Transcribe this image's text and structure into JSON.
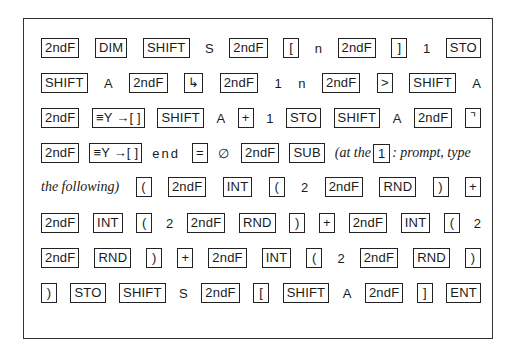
{
  "rows": [
    {
      "tokens": [
        {
          "t": "key",
          "v": "2ndF"
        },
        {
          "t": "key",
          "v": "DIM"
        },
        {
          "t": "key",
          "v": "SHIFT"
        },
        {
          "t": "txt",
          "v": "S"
        },
        {
          "t": "key",
          "v": "2ndF"
        },
        {
          "t": "key",
          "v": "["
        },
        {
          "t": "txt",
          "v": "n"
        },
        {
          "t": "key",
          "v": "2ndF"
        },
        {
          "t": "key",
          "v": "]"
        },
        {
          "t": "txt",
          "v": "1"
        },
        {
          "t": "key",
          "v": "STO"
        }
      ]
    },
    {
      "tokens": [
        {
          "t": "key",
          "v": "SHIFT"
        },
        {
          "t": "txt",
          "v": "A"
        },
        {
          "t": "key",
          "v": "2ndF"
        },
        {
          "t": "key",
          "v": "↳"
        },
        {
          "t": "key",
          "v": "2ndF"
        },
        {
          "t": "txt",
          "v": "1"
        },
        {
          "t": "txt",
          "v": "n"
        },
        {
          "t": "key",
          "v": "2ndF"
        },
        {
          "t": "key",
          "v": ">"
        },
        {
          "t": "key",
          "v": "SHIFT"
        },
        {
          "t": "txt",
          "v": "A"
        }
      ]
    },
    {
      "tokens": [
        {
          "t": "key",
          "v": "2ndF"
        },
        {
          "t": "key",
          "v": "≡Y →[ ]"
        },
        {
          "t": "key",
          "v": "SHIFT"
        },
        {
          "t": "txt",
          "v": "A"
        },
        {
          "t": "key",
          "v": "+"
        },
        {
          "t": "txt",
          "v": "1"
        },
        {
          "t": "key",
          "v": "STO"
        },
        {
          "t": "key",
          "v": "SHIFT"
        },
        {
          "t": "txt",
          "v": "A"
        },
        {
          "t": "key",
          "v": "2ndF"
        },
        {
          "t": "key",
          "v": "⌝"
        }
      ]
    },
    {
      "tokens": [
        {
          "t": "key",
          "v": "2ndF"
        },
        {
          "t": "key",
          "v": "≡Y →[ ]"
        },
        {
          "t": "txt",
          "v": "end",
          "spaced": true
        },
        {
          "t": "key",
          "v": "="
        },
        {
          "t": "txt",
          "v": "∅"
        },
        {
          "t": "key",
          "v": "2ndF"
        },
        {
          "t": "key",
          "v": "SUB"
        },
        {
          "t": "note",
          "before": "(at the ",
          "key": "1",
          "after": ": prompt, type"
        }
      ]
    },
    {
      "tokens": [
        {
          "t": "ital",
          "v": "the following)"
        },
        {
          "t": "key",
          "v": "("
        },
        {
          "t": "key",
          "v": "2ndF"
        },
        {
          "t": "key",
          "v": "INT"
        },
        {
          "t": "key",
          "v": "("
        },
        {
          "t": "txt",
          "v": "2"
        },
        {
          "t": "key",
          "v": "2ndF"
        },
        {
          "t": "key",
          "v": "RND"
        },
        {
          "t": "key",
          "v": ")"
        },
        {
          "t": "key",
          "v": "+"
        }
      ]
    },
    {
      "tokens": [
        {
          "t": "key",
          "v": "2ndF"
        },
        {
          "t": "key",
          "v": "INT"
        },
        {
          "t": "key",
          "v": "("
        },
        {
          "t": "txt",
          "v": "2"
        },
        {
          "t": "key",
          "v": "2ndF"
        },
        {
          "t": "key",
          "v": "RND"
        },
        {
          "t": "key",
          "v": ")"
        },
        {
          "t": "key",
          "v": "+"
        },
        {
          "t": "key",
          "v": "2ndF"
        },
        {
          "t": "key",
          "v": "INT"
        },
        {
          "t": "key",
          "v": "("
        },
        {
          "t": "txt",
          "v": "2"
        }
      ]
    },
    {
      "tokens": [
        {
          "t": "key",
          "v": "2ndF"
        },
        {
          "t": "key",
          "v": "RND"
        },
        {
          "t": "key",
          "v": ")"
        },
        {
          "t": "key",
          "v": "+"
        },
        {
          "t": "key",
          "v": "2ndF"
        },
        {
          "t": "key",
          "v": "INT"
        },
        {
          "t": "key",
          "v": "("
        },
        {
          "t": "txt",
          "v": "2"
        },
        {
          "t": "key",
          "v": "2ndF"
        },
        {
          "t": "key",
          "v": "RND"
        },
        {
          "t": "key",
          "v": ")"
        }
      ]
    },
    {
      "tokens": [
        {
          "t": "key",
          "v": ")"
        },
        {
          "t": "key",
          "v": "STO"
        },
        {
          "t": "key",
          "v": "SHIFT"
        },
        {
          "t": "txt",
          "v": "S"
        },
        {
          "t": "key",
          "v": "2ndF"
        },
        {
          "t": "key",
          "v": "["
        },
        {
          "t": "key",
          "v": "SHIFT"
        },
        {
          "t": "txt",
          "v": "A"
        },
        {
          "t": "key",
          "v": "2ndF"
        },
        {
          "t": "key",
          "v": "]"
        },
        {
          "t": "key",
          "v": "ENT"
        }
      ]
    }
  ]
}
